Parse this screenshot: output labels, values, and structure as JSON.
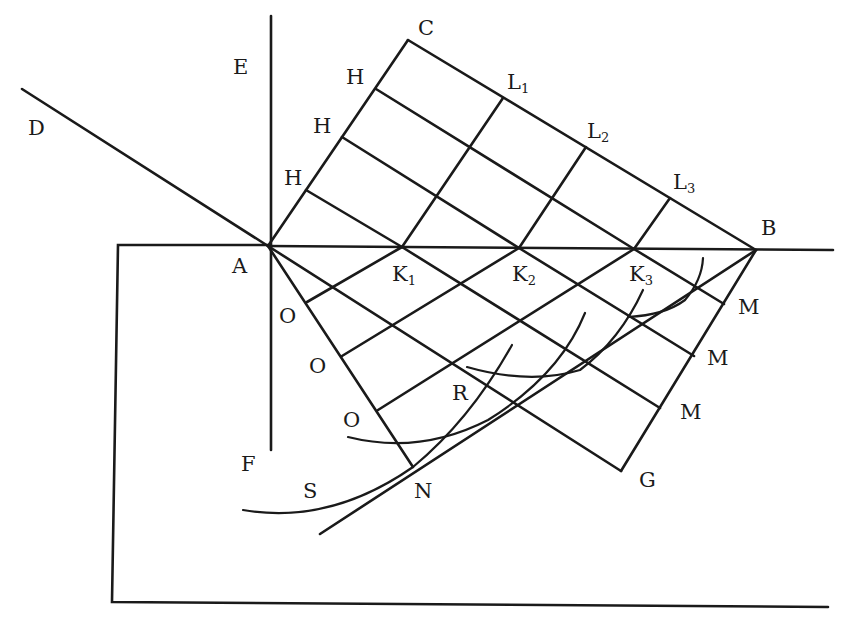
{
  "diagram": {
    "title": "",
    "stroke_color": "#1a1a1a",
    "background": "#ffffff",
    "points": {
      "A": [
        268,
        246
      ],
      "B": [
        756,
        250
      ],
      "C": [
        408,
        40
      ],
      "D": [
        22,
        89
      ],
      "E": [
        271,
        16
      ],
      "F": [
        271,
        450
      ],
      "G": [
        621,
        471
      ],
      "N": [
        413,
        467
      ],
      "R": [
        453,
        366
      ],
      "K1": [
        402,
        247
      ],
      "K2": [
        519,
        248
      ],
      "K3": [
        634,
        249
      ],
      "L1": [
        490,
        108
      ],
      "L2": [
        573,
        158
      ],
      "L3": [
        660,
        208
      ],
      "H1": [
        376,
        89
      ],
      "H2": [
        342,
        137
      ],
      "H3": [
        306,
        190
      ],
      "O1": [
        307,
        302
      ],
      "O2": [
        342,
        356
      ],
      "O3": [
        378,
        410
      ],
      "M1": [
        724,
        304
      ],
      "M2": [
        694,
        356
      ],
      "M3": [
        660,
        408
      ]
    },
    "labels": [
      {
        "id": "C",
        "text": "C",
        "x": 418,
        "y": 18
      },
      {
        "id": "E",
        "text": "E",
        "x": 233,
        "y": 57
      },
      {
        "id": "H1",
        "text": "H",
        "x": 346,
        "y": 67
      },
      {
        "id": "H2",
        "text": "H",
        "x": 313,
        "y": 116
      },
      {
        "id": "H3",
        "text": "H",
        "x": 284,
        "y": 168
      },
      {
        "id": "D",
        "text": "D",
        "x": 28,
        "y": 118
      },
      {
        "id": "L1",
        "text": "L",
        "sub": "1",
        "x": 507,
        "y": 72
      },
      {
        "id": "L2",
        "text": "L",
        "sub": "2",
        "x": 587,
        "y": 121
      },
      {
        "id": "L3",
        "text": "L",
        "sub": "3",
        "x": 673,
        "y": 172
      },
      {
        "id": "B",
        "text": "B",
        "x": 761,
        "y": 218
      },
      {
        "id": "A",
        "text": "A",
        "x": 232,
        "y": 256
      },
      {
        "id": "K1",
        "text": "K",
        "sub": "1",
        "x": 392,
        "y": 264
      },
      {
        "id": "K2",
        "text": "K",
        "sub": "2",
        "x": 512,
        "y": 264
      },
      {
        "id": "K3",
        "text": "K",
        "sub": "3",
        "x": 629,
        "y": 264
      },
      {
        "id": "O1",
        "text": "O",
        "x": 279,
        "y": 306
      },
      {
        "id": "O2",
        "text": "O",
        "x": 309,
        "y": 356
      },
      {
        "id": "O3",
        "text": "O",
        "x": 343,
        "y": 410
      },
      {
        "id": "M1",
        "text": "M",
        "x": 738,
        "y": 297
      },
      {
        "id": "M2",
        "text": "M",
        "x": 707,
        "y": 348
      },
      {
        "id": "M3",
        "text": "M",
        "x": 680,
        "y": 402
      },
      {
        "id": "R",
        "text": "R",
        "x": 452,
        "y": 383
      },
      {
        "id": "F",
        "text": "F",
        "x": 241,
        "y": 454
      },
      {
        "id": "S",
        "text": "S",
        "x": 303,
        "y": 481
      },
      {
        "id": "N",
        "text": "N",
        "x": 414,
        "y": 481
      },
      {
        "id": "G",
        "text": "G",
        "x": 639,
        "y": 470
      }
    ],
    "caption": "Huygens construction of refraction: wavefront AC, surface AB, refracted wavefront BN with secondary wavelets"
  }
}
